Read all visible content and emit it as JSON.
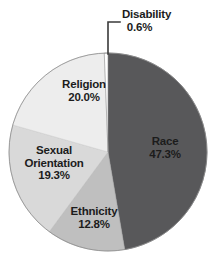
{
  "chart_data": {
    "type": "pie",
    "title": "",
    "subtitle": "",
    "xlabel": "",
    "ylabel": "",
    "legend_position": "none",
    "grid": false,
    "start_angle_deg": 0,
    "direction": "clockwise",
    "categories": [
      "Race",
      "Ethnicity",
      "Sexual Orientation",
      "Religion",
      "Disability"
    ],
    "values": [
      47.3,
      12.8,
      19.3,
      20.0,
      0.6
    ],
    "value_suffix": "%",
    "slices": [
      {
        "label": "Race",
        "value": 47.3,
        "value_text": "47.3%",
        "color": "#58585a",
        "label_placement": "inside",
        "leader_line": false
      },
      {
        "label": "Ethnicity",
        "value": 12.8,
        "value_text": "12.8%",
        "color": "#bfbfbf",
        "label_placement": "inside",
        "leader_line": false
      },
      {
        "label": "Sexual Orientation",
        "value": 19.3,
        "value_text": "19.3%",
        "color": "#d9d9d9",
        "label_placement": "inside",
        "leader_line": false
      },
      {
        "label": "Religion",
        "value": 20.0,
        "value_text": "20.0%",
        "color": "#ededed",
        "label_placement": "inside",
        "leader_line": false
      },
      {
        "label": "Disability",
        "value": 0.6,
        "value_text": "0.6%",
        "color": "#ffffff",
        "label_placement": "outside",
        "leader_line": true
      }
    ]
  },
  "labels": {
    "race": {
      "name": "Race",
      "value": "47.3%"
    },
    "ethnicity": {
      "name": "Ethnicity",
      "value": "12.8%"
    },
    "sexual_orientation": {
      "name_line1": "Sexual",
      "name_line2": "Orientation",
      "value": "19.3%"
    },
    "religion": {
      "name": "Religion",
      "value": "20.0%"
    },
    "disability": {
      "name": "Disability",
      "value": "0.6%"
    }
  },
  "style": {
    "background": "#ffffff",
    "text_color": "#1c1c1c",
    "outline_color": "#8d8d8d",
    "leader_line_color": "#3a3a3a"
  }
}
